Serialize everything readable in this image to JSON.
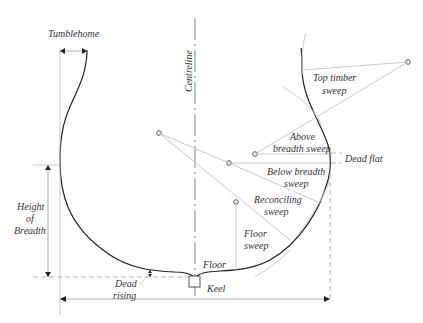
{
  "diagram": {
    "labels": {
      "tumblehome": "Tumblehome",
      "centreline": "Centreline",
      "height_of_breadth_1": "Height",
      "height_of_breadth_2": "of",
      "height_of_breadth_3": "Breadth",
      "dead_rising_1": "Dead",
      "dead_rising_2": "rising",
      "floor": "Floor",
      "keel": "Keel",
      "top_timber_sweep_1": "Top timber",
      "top_timber_sweep_2": "sweep",
      "above_breadth_sweep_1": "Above",
      "above_breadth_sweep_2": "breadth sweep",
      "dead_flat": "Dead flat",
      "below_breadth_sweep_1": "Below breadth",
      "below_breadth_sweep_2": "sweep",
      "reconciling_sweep_1": "Reconciling",
      "reconciling_sweep_2": "sweep",
      "floor_sweep_1": "Floor",
      "floor_sweep_2": "sweep"
    },
    "colors": {
      "hull_line": "#222222",
      "construction_line": "#c4c4c4",
      "text": "#333333",
      "background": "#ffffff"
    }
  }
}
